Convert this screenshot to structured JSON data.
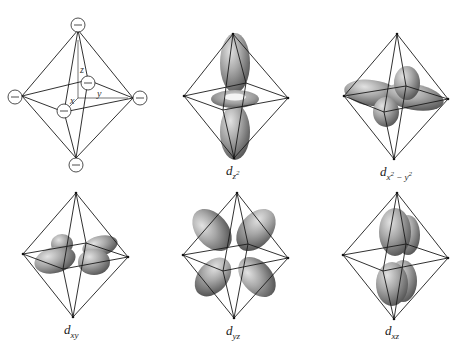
{
  "figure": {
    "ligand_charge_symbol": "−",
    "axes": {
      "x": "x",
      "y": "y",
      "z": "z"
    },
    "panels": [
      {
        "id": "ligands",
        "label": null
      },
      {
        "id": "dz2",
        "label_main": "d",
        "label_sub": "z",
        "label_sup": "2"
      },
      {
        "id": "dx2y2",
        "label_main": "d",
        "label_sub_1": "x",
        "label_sup_1": "2",
        "label_mid": " − ",
        "label_sub_2": "y",
        "label_sup_2": "2"
      },
      {
        "id": "dxy",
        "label_main": "d",
        "label_sub": "xy"
      },
      {
        "id": "dyz",
        "label_main": "d",
        "label_sub": "yz"
      },
      {
        "id": "dxz",
        "label_main": "d",
        "label_sub": "xz"
      }
    ]
  },
  "colors": {
    "orbital_light": "#d6d6d6",
    "orbital_mid": "#a0a0a0",
    "orbital_dark": "#5e5e5e",
    "edge": "#1a1a1a",
    "background": "#ffffff"
  }
}
